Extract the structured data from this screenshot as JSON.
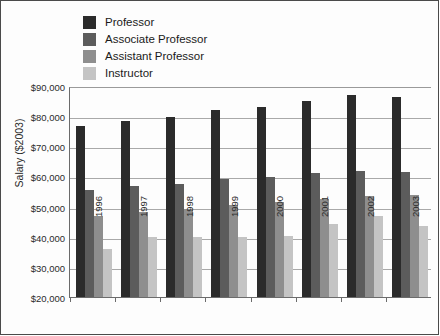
{
  "chart_data": {
    "type": "bar",
    "title": "",
    "xlabel": "",
    "ylabel": "Salary ($2003)",
    "ylim": [
      20000,
      90000
    ],
    "ytick_step": 10000,
    "grid": true,
    "legend_position": "top-left",
    "categories": [
      "1996",
      "1997",
      "1998",
      "1999",
      "2000",
      "2001",
      "2002",
      "2003"
    ],
    "ytick_labels": [
      "$90,000",
      "$80,000",
      "$70,000",
      "$60,000",
      "$50,000",
      "$40,000",
      "$30,000",
      "$20,000"
    ],
    "ytick_values": [
      90000,
      80000,
      70000,
      60000,
      50000,
      40000,
      30000,
      20000
    ],
    "series": [
      {
        "name": "Professor",
        "color": "#2b2b2b",
        "values": [
          77000,
          78800,
          80200,
          82400,
          83400,
          85200,
          87300,
          86600
        ]
      },
      {
        "name": "Associate Professor",
        "color": "#5c5c5c",
        "values": [
          55700,
          57100,
          57700,
          59600,
          60200,
          61500,
          62300,
          61700
        ]
      },
      {
        "name": "Assistant Professor",
        "color": "#8e8e8e",
        "values": [
          47300,
          48600,
          49400,
          51000,
          51800,
          52800,
          54000,
          54200
        ]
      },
      {
        "name": "Instructor",
        "color": "#c4c4c4",
        "values": [
          36300,
          40200,
          40300,
          40400,
          40500,
          44700,
          47100,
          44000
        ]
      }
    ]
  }
}
